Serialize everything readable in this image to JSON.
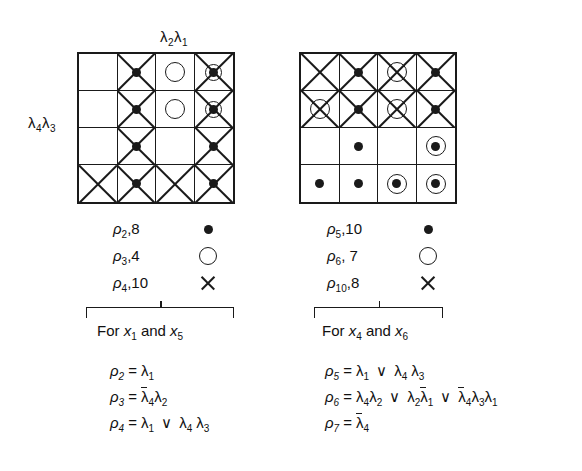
{
  "figure": {
    "left": {
      "axis_top": "λ₂λ₁",
      "axis_left": "λ₄λ₃",
      "caption": "For x₁ and x₅",
      "legend": [
        {
          "label": "ρ₂,8",
          "symbol": "filled-dot"
        },
        {
          "label": "ρ₃,4",
          "symbol": "open-circle"
        },
        {
          "label": "ρ₄,10",
          "symbol": "x-cross"
        }
      ],
      "equations": [
        "ρ₂ = λ₁",
        "ρ₃ = λ̄₄λ₂",
        "ρ₄ = λ₁ ∨ λ₄λ₃"
      ],
      "grid": [
        [
          "",
          "x dot",
          "circle",
          "x circle dot"
        ],
        [
          "",
          "x dot",
          "circle",
          "x circle dot"
        ],
        [
          "",
          "x dot",
          "",
          "x dot"
        ],
        [
          "x",
          "x dot",
          "x",
          "x dot"
        ]
      ]
    },
    "right": {
      "caption": "For x₄ and x₆",
      "legend": [
        {
          "label": "ρ₅,10",
          "symbol": "filled-dot"
        },
        {
          "label": "ρ₆, 7",
          "symbol": "open-circle"
        },
        {
          "label": "ρ₁₀,8",
          "symbol": "x-cross"
        }
      ],
      "equations": [
        "ρ₅ = λ₁ ∨ λ₄λ₃",
        "ρ₆ = λ₄λ₂ ∨ λ₂λ̄₁ ∨ λ̄₄λ₃λ₁",
        "ρ₇ = λ̄₄"
      ],
      "grid": [
        [
          "x",
          "x dot",
          "x circle",
          "x dot"
        ],
        [
          "x circle",
          "x dot",
          "x circle",
          "x dot"
        ],
        [
          "",
          "dot",
          "",
          "circle dot"
        ],
        [
          "dot",
          "dot",
          "circle dot",
          "circle dot"
        ]
      ]
    }
  },
  "colors": {
    "ink": "#1a1a1a",
    "background": "#ffffff"
  }
}
